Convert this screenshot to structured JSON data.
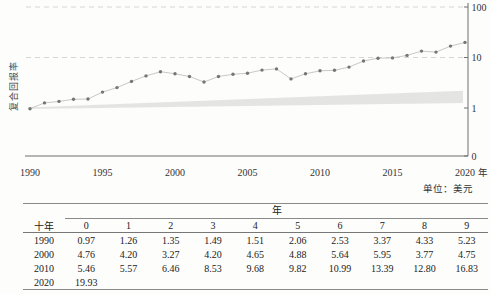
{
  "figure": {
    "ylabel": "复合回报率",
    "xlabel": "年",
    "unit_note": "单位：美元"
  },
  "chart_data": {
    "type": "line",
    "title": "",
    "ylabel": "复合回报率",
    "xlabel": "年",
    "yscale": "log",
    "grid": "dashed horizontal at 10 and 100",
    "legend": "none",
    "x": [
      1990,
      1991,
      1992,
      1993,
      1994,
      1995,
      1996,
      1997,
      1998,
      1999,
      2000,
      2001,
      2002,
      2003,
      2004,
      2005,
      2006,
      2007,
      2008,
      2009,
      2010,
      2011,
      2012,
      2013,
      2014,
      2015,
      2016,
      2017,
      2018,
      2019,
      2020
    ],
    "series": [
      {
        "name": "复合回报率（美元）",
        "values": [
          0.97,
          1.26,
          1.35,
          1.49,
          1.51,
          2.06,
          2.53,
          3.37,
          4.33,
          5.23,
          4.76,
          4.2,
          3.27,
          4.2,
          4.65,
          4.88,
          5.64,
          5.95,
          3.77,
          4.75,
          5.46,
          5.57,
          6.46,
          8.53,
          9.68,
          9.82,
          10.99,
          13.39,
          12.8,
          16.83,
          19.93
        ]
      }
    ],
    "band": {
      "name": "shaded-reference-band",
      "start_top": 1.02,
      "start_bottom": 0.95,
      "end_top": 2.2,
      "end_bottom": 1.25
    },
    "x_ticks": [
      "1990",
      "1995",
      "2000",
      "2005",
      "2010",
      "2015",
      "2020"
    ],
    "x_tick_years": [
      1990,
      1995,
      2000,
      2005,
      2010,
      2015,
      2020
    ],
    "y_ticks": [
      "100",
      "10",
      "1",
      "0"
    ],
    "y_tick_values": [
      100,
      10,
      1,
      0
    ],
    "gridlines_at": [
      100,
      10
    ],
    "xlim": [
      1990,
      2020
    ],
    "unit_note": "单位：美元"
  },
  "table": {
    "span_header": "年",
    "row_header": "十年",
    "col_headers": [
      "0",
      "1",
      "2",
      "3",
      "4",
      "5",
      "6",
      "7",
      "8",
      "9"
    ],
    "rows": [
      {
        "label": "1990",
        "values": [
          "0.97",
          "1.26",
          "1.35",
          "1.49",
          "1.51",
          "2.06",
          "2.53",
          "3.37",
          "4.33",
          "5.23"
        ]
      },
      {
        "label": "2000",
        "values": [
          "4.76",
          "4.20",
          "3.27",
          "4.20",
          "4.65",
          "4.88",
          "5.64",
          "5.95",
          "3.77",
          "4.75"
        ]
      },
      {
        "label": "2010",
        "values": [
          "5.46",
          "5.57",
          "6.46",
          "8.53",
          "9.68",
          "9.82",
          "10.99",
          "13.39",
          "12.80",
          "16.83"
        ]
      },
      {
        "label": "2020",
        "values": [
          "19.93"
        ]
      }
    ]
  },
  "colors": {
    "marker": "#757575",
    "line": "#c2c2c2",
    "band_fill": "#e1e1e0",
    "gridline": "#d6d6d4",
    "axis": "#6f6f6f",
    "rule": "#8a8a8a",
    "text": "#333333"
  }
}
